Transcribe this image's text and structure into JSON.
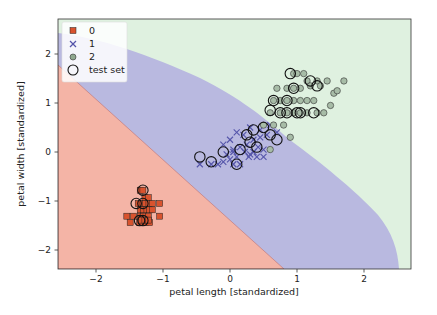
{
  "chart_data": {
    "type": "scatter",
    "title": "",
    "xlabel": "petal length [standardized]",
    "ylabel": "petal width [standardized]",
    "xlim": [
      -2.6,
      2.7
    ],
    "ylim": [
      -2.4,
      2.7
    ],
    "xticks": [
      -2,
      -1,
      0,
      1,
      2
    ],
    "yticks": [
      -2,
      -1,
      0,
      1,
      2
    ],
    "grid": false,
    "legend_position": "upper left",
    "legend": [
      {
        "label": "0",
        "marker": "square",
        "color": "#d9532e"
      },
      {
        "label": "1",
        "marker": "x",
        "color": "#5555aa"
      },
      {
        "label": "2",
        "marker": "circle",
        "color": "#8fa88f"
      },
      {
        "label": "test set",
        "marker": "open-circle",
        "color": "#111111"
      }
    ],
    "decision_regions": [
      {
        "class": "0",
        "color": "#f4b4a6"
      },
      {
        "class": "1",
        "color": "#b9b9e0"
      },
      {
        "class": "2",
        "color": "#dff1e0"
      }
    ],
    "series": [
      {
        "name": "0",
        "marker": "square",
        "x": [
          -1.34,
          -1.3,
          -1.27,
          -1.22,
          -1.37,
          -1.3,
          -1.26,
          -1.21,
          -1.16,
          -1.05,
          -1.34,
          -1.29,
          -1.24,
          -1.2,
          -1.16,
          -1.54,
          -1.44,
          -1.34,
          -1.29,
          -1.22,
          -1.05,
          -1.49,
          -1.35,
          -1.3,
          -1.26,
          -1.2,
          -1.32,
          -1.27,
          -1.22
        ],
        "y": [
          -0.78,
          -0.78,
          -0.93,
          -0.93,
          -1.05,
          -1.05,
          -1.05,
          -1.05,
          -1.05,
          -1.05,
          -1.18,
          -1.18,
          -1.18,
          -1.18,
          -1.18,
          -1.31,
          -1.31,
          -1.31,
          -1.31,
          -1.31,
          -1.31,
          -1.44,
          -1.44,
          -1.44,
          -1.44,
          -1.44,
          -1.39,
          -1.39,
          -1.39
        ]
      },
      {
        "name": "1",
        "marker": "x",
        "x": [
          -0.45,
          -0.28,
          -0.18,
          -0.1,
          0.0,
          0.05,
          0.1,
          0.15,
          0.22,
          0.28,
          0.35,
          0.42,
          0.5,
          -0.1,
          0.0,
          0.1,
          0.2,
          0.3,
          0.45,
          0.6,
          0.05,
          0.15,
          0.25,
          0.35,
          0.45,
          0.55,
          0.7,
          0.3,
          0.4,
          0.5,
          0.05,
          -0.05
        ],
        "y": [
          -0.25,
          -0.25,
          -0.25,
          -0.2,
          -0.15,
          -0.25,
          -0.1,
          -0.25,
          0.0,
          -0.1,
          0.0,
          0.1,
          0.05,
          0.15,
          0.25,
          0.4,
          0.35,
          0.5,
          0.45,
          0.55,
          0.0,
          0.1,
          0.15,
          0.25,
          0.3,
          0.35,
          0.4,
          -0.05,
          -0.1,
          -0.1,
          0.05,
          -0.05
        ]
      },
      {
        "name": "2",
        "marker": "circle",
        "x": [
          0.65,
          0.75,
          0.85,
          0.95,
          1.05,
          1.15,
          1.25,
          0.7,
          0.85,
          0.95,
          1.05,
          1.15,
          1.3,
          1.45,
          1.55,
          1.7,
          0.6,
          0.75,
          0.85,
          0.95,
          1.05,
          1.15,
          1.3,
          1.4,
          0.95,
          1.0,
          1.1,
          1.2,
          1.35,
          0.5,
          0.65,
          0.8,
          1.5,
          1.6,
          0.9,
          0.6
        ],
        "y": [
          1.05,
          1.05,
          1.05,
          1.05,
          1.05,
          1.05,
          1.05,
          1.3,
          1.3,
          1.3,
          1.3,
          1.45,
          1.45,
          1.45,
          1.2,
          1.45,
          0.8,
          0.8,
          0.8,
          0.8,
          0.8,
          0.8,
          0.8,
          0.8,
          1.6,
          1.6,
          1.6,
          1.35,
          1.35,
          0.55,
          0.55,
          0.55,
          0.95,
          1.25,
          0.3,
          0.05
        ]
      },
      {
        "name": "test set",
        "marker": "open-circle",
        "x": [
          -1.3,
          -1.4,
          -1.3,
          -1.35,
          -1.3,
          -0.45,
          -0.28,
          0.1,
          -0.1,
          0.15,
          0.25,
          0.35,
          0.5,
          0.4,
          0.3,
          0.6,
          0.75,
          0.85,
          0.95,
          1.05,
          1.2,
          0.65,
          0.85,
          1.0,
          1.25,
          0.9,
          1.3,
          0.6,
          0.7
        ],
        "y": [
          -0.78,
          -1.05,
          -1.05,
          -1.4,
          -1.4,
          -0.1,
          -0.2,
          -0.25,
          0.0,
          0.05,
          0.35,
          0.45,
          0.5,
          0.1,
          0.2,
          0.85,
          0.8,
          1.05,
          1.3,
          0.8,
          1.45,
          1.05,
          0.8,
          0.8,
          0.8,
          1.6,
          1.35,
          0.35,
          0.25
        ]
      }
    ]
  }
}
